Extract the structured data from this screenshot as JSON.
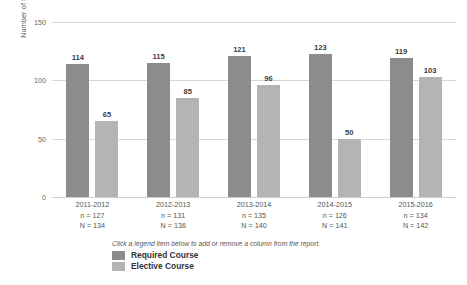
{
  "chart_data": {
    "type": "bar",
    "title": "",
    "xlabel": "",
    "ylabel": "Number of Medical Schools",
    "ylim": [
      0,
      150
    ],
    "yticks": [
      0,
      50,
      100,
      150
    ],
    "grid": true,
    "legend_position": "bottom-left",
    "categories": [
      "2011-2012",
      "2012-2013",
      "2013-2014",
      "2014-2015",
      "2015-2016"
    ],
    "category_sublabels": [
      [
        "n = 127",
        "N = 134"
      ],
      [
        "n = 131",
        "N = 136"
      ],
      [
        "n = 135",
        "N = 140"
      ],
      [
        "n = 126",
        "N = 141"
      ],
      [
        "n = 134",
        "N = 142"
      ]
    ],
    "series": [
      {
        "name": "Required Course",
        "color": "#8c8c8c",
        "values": [
          114,
          115,
          121,
          123,
          119
        ]
      },
      {
        "name": "Elective Course",
        "color": "#b4b4b4",
        "values": [
          65,
          85,
          96,
          50,
          103
        ]
      }
    ]
  },
  "axis": {
    "y_title": "Number of Medical Schools",
    "y_tick_labels": [
      "150",
      "100",
      "50",
      "0"
    ]
  },
  "legend": {
    "hint": "Click a legend item below to add or remove a column from the report.",
    "items": [
      {
        "label": "Required Course",
        "color": "#8c8c8c"
      },
      {
        "label": "Elective Course",
        "color": "#b4b4b4"
      }
    ]
  }
}
